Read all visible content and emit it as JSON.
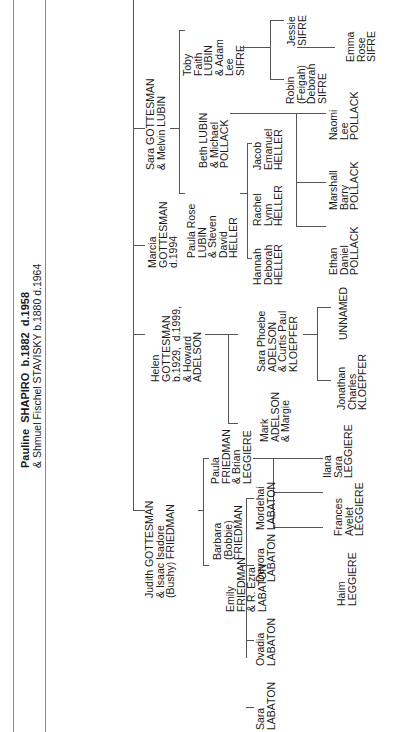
{
  "title": {
    "line1": "Pauline  SHAPIRO  b.1882  d.1958",
    "line2": "& Shmuel Fischel STAVISKY b.1880 d.1964"
  },
  "generation1": [
    {
      "id": "sara-gottesman",
      "text": "Sara GOTTESMAN\n& Melvin LUBIN"
    },
    {
      "id": "marcia-gottesman",
      "text": "Marcia\nGOTTESMAN\nd.1994"
    },
    {
      "id": "helen-gottesman",
      "text": "Helen\nGOTTESMAN\nb.1929,  d.1999,\n& Howard\nADELSON"
    },
    {
      "id": "judith-gottesman",
      "text": "Judith GOTTESMAN\n& Isaac Isadore\n(Bushy) FRIEDMAN"
    }
  ],
  "generation2": [
    {
      "id": "toby-lubin",
      "text": "Toby\nFaith\nLUBIN\n& Adam\nLee\nSIFRE"
    },
    {
      "id": "beth-lubin",
      "text": "Beth LUBIN\n& Michael\nPOLLACK"
    },
    {
      "id": "paula-rose-lubin",
      "text": "Paula Rose\nLUBIN\n& Steven\nDavid\nHELLER"
    },
    {
      "id": "sara-phoebe-adelson",
      "text": "Sara Phoebe\nADELSON\n& Curtis Paul\nKLOEPFER"
    },
    {
      "id": "mark-adelson",
      "text": "Mark\nADELSON\n& Margie"
    },
    {
      "id": "paula-friedman",
      "text": "Paula\nFRIEDMAN\n& Brian\nLEGGIERE"
    },
    {
      "id": "barbara-friedman",
      "text": "Barbara\n(Bobbie)\nFRIEDMAN"
    },
    {
      "id": "emily-friedman",
      "text": "Emily\nFRIEDMAN\n& R. Ezra\nLABATON"
    }
  ],
  "generation3": [
    {
      "id": "jessie-sifre",
      "text": "Jessie\nSIFRE"
    },
    {
      "id": "robin-sifre",
      "text": "Robin\n(Feigah)\nDeborah\nSIFRE"
    },
    {
      "id": "naomi-pollack",
      "text": "Naomi\nLee\nPOLLACK"
    },
    {
      "id": "marshall-pollack",
      "text": "Marshall\nBarry\nPOLLACK"
    },
    {
      "id": "ethan-pollack",
      "text": "Ethan\nDaniel\nPOLLACK"
    },
    {
      "id": "jacob-heller",
      "text": "Jacob\nEmanuel\nHELLER"
    },
    {
      "id": "rachel-heller",
      "text": "Rachel\nLynn\nHELLER"
    },
    {
      "id": "hannah-heller",
      "text": "Hannah\nDeborah\nHELLER"
    },
    {
      "id": "unnamed",
      "text": "UNNAMED"
    },
    {
      "id": "jonathan-kloepfer",
      "text": "Jonathan\nCharles\nKLOEPFER"
    },
    {
      "id": "ilana-leggiere",
      "text": "Ilana\nSara\nLEGGIERE"
    },
    {
      "id": "frances-leggiere",
      "text": "Frances\nAyelet\nLEGGIERE"
    },
    {
      "id": "haim-leggiere",
      "text": "Haim\nLEGGIERE"
    },
    {
      "id": "mordehai-labaton",
      "text": "Mordehai\nLABATON"
    },
    {
      "id": "devora-labaton",
      "text": "Devora\nLABATON"
    },
    {
      "id": "ovadia-labaton",
      "text": "Ovadia\nLABATON"
    },
    {
      "id": "sara-labaton",
      "text": "Sara\nLABATON"
    }
  ],
  "generation4": [
    {
      "id": "emma-sifre",
      "text": "Emma\nRose\nSIFRE"
    }
  ]
}
